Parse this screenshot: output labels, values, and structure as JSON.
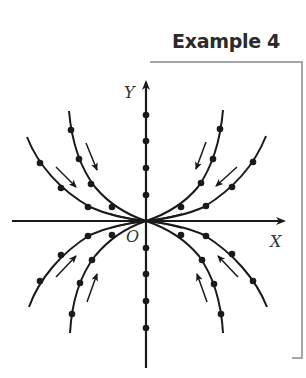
{
  "title": "Example 4",
  "axes": {
    "x_label": "X",
    "y_label": "Y",
    "origin_label": "O"
  },
  "colors": {
    "ink": "#1a1a1a",
    "frame": "#8a8a8a",
    "title": "#2a2a2a"
  },
  "diagram": {
    "type": "phase-portrait",
    "curves_per_quadrant": 2,
    "y_axis_dots": 8
  }
}
